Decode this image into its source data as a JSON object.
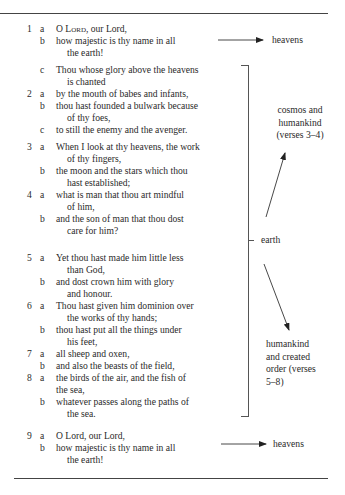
{
  "psalm": {
    "lines": [
      {
        "num": "1",
        "let": "a",
        "text": "O Lord, our Lord,",
        "smallcaps_word": "Lord",
        "top": 23,
        "cont": false,
        "has_lord": true
      },
      {
        "num": "",
        "let": "b",
        "text": "how majestic is thy name in all",
        "top": 35,
        "cont": false
      },
      {
        "num": "",
        "let": "",
        "text": "the earth!",
        "top": 47,
        "cont": true
      },
      {
        "num": "",
        "let": "c",
        "text": "Thou whose glory above the heavens",
        "top": 64,
        "cont": false
      },
      {
        "num": "",
        "let": "",
        "text": "is chanted",
        "top": 76,
        "cont": true
      },
      {
        "num": "2",
        "let": "a",
        "text": "by the mouth of babes and infants,",
        "top": 88,
        "cont": false
      },
      {
        "num": "",
        "let": "b",
        "text": "thou hast founded a bulwark because",
        "top": 100,
        "cont": false
      },
      {
        "num": "",
        "let": "",
        "text": "of thy foes,",
        "top": 112,
        "cont": true
      },
      {
        "num": "",
        "let": "c",
        "text": "to still the enemy and the avenger.",
        "top": 124,
        "cont": false
      },
      {
        "num": "3",
        "let": "a",
        "text": "When I look at thy heavens, the work",
        "top": 141,
        "cont": false
      },
      {
        "num": "",
        "let": "",
        "text": "of thy fingers,",
        "top": 153,
        "cont": true
      },
      {
        "num": "",
        "let": "b",
        "text": "the moon and the stars which thou",
        "top": 165,
        "cont": false
      },
      {
        "num": "",
        "let": "",
        "text": "hast established;",
        "top": 177,
        "cont": true
      },
      {
        "num": "4",
        "let": "a",
        "text": "what is man that thou art mindful",
        "top": 189,
        "cont": false
      },
      {
        "num": "",
        "let": "",
        "text": "of him,",
        "top": 201,
        "cont": true
      },
      {
        "num": "",
        "let": "b",
        "text": "and the son of man that thou dost",
        "top": 213,
        "cont": false
      },
      {
        "num": "",
        "let": "",
        "text": "care for him?",
        "top": 225,
        "cont": true
      },
      {
        "num": "5",
        "let": "a",
        "text": "Yet thou hast made him little less",
        "top": 252,
        "cont": false
      },
      {
        "num": "",
        "let": "",
        "text": "than God,",
        "top": 264,
        "cont": true
      },
      {
        "num": "",
        "let": "b",
        "text": "and dost crown him with glory",
        "top": 276,
        "cont": false
      },
      {
        "num": "",
        "let": "",
        "text": "and honour.",
        "top": 288,
        "cont": true
      },
      {
        "num": "6",
        "let": "a",
        "text": "Thou hast given him dominion over",
        "top": 300,
        "cont": false
      },
      {
        "num": "",
        "let": "",
        "text": "the works of thy hands;",
        "top": 312,
        "cont": true
      },
      {
        "num": "",
        "let": "b",
        "text": "thou hast put all the things under",
        "top": 324,
        "cont": false
      },
      {
        "num": "",
        "let": "",
        "text": "his feet,",
        "top": 336,
        "cont": true
      },
      {
        "num": "7",
        "let": "a",
        "text": "all sheep and oxen,",
        "top": 348,
        "cont": false
      },
      {
        "num": "",
        "let": "b",
        "text": "and also the beasts of the field,",
        "top": 360,
        "cont": false
      },
      {
        "num": "8",
        "let": "a",
        "text": "the birds of the air, and the fish of",
        "top": 372,
        "cont": false
      },
      {
        "num": "",
        "let": "",
        "text": "the sea,",
        "top": 384,
        "cont": false
      },
      {
        "num": "",
        "let": "b",
        "text": "whatever passes along the paths of",
        "top": 396,
        "cont": false
      },
      {
        "num": "",
        "let": "",
        "text": "the sea.",
        "top": 408,
        "cont": true
      },
      {
        "num": "9",
        "let": "a",
        "text": "O Lord, our Lord,",
        "top": 430,
        "cont": false,
        "has_lord": true
      },
      {
        "num": "",
        "let": "b",
        "text": "how majestic is thy name in all",
        "top": 442,
        "cont": false
      },
      {
        "num": "",
        "let": "",
        "text": "the earth!",
        "top": 454,
        "cont": true
      }
    ]
  },
  "labels": {
    "heavens_top": "heavens",
    "cosmos": [
      "cosmos and",
      "humankind",
      "(verses 3–4)"
    ],
    "earth": "earth",
    "humankind": [
      "humankind",
      "and created",
      "order (verses",
      "5–8)"
    ],
    "heavens_bottom": "heavens"
  }
}
